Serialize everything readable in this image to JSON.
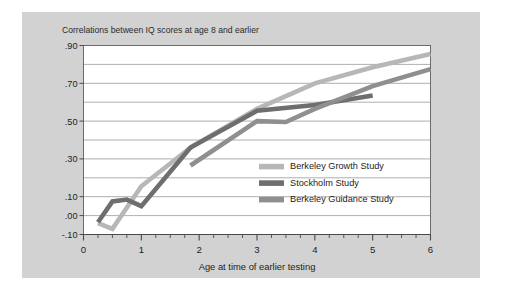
{
  "figure": {
    "background_color": "#ffffff",
    "panel_color": "#d2d2d2",
    "plot_color": "#ffffff"
  },
  "chart_data": {
    "type": "line",
    "title": "Correlations between IQ scores at age 8 and earlier",
    "xlabel": "Age at time of earlier testing",
    "ylabel": "",
    "xlim": [
      0,
      6
    ],
    "ylim": [
      -0.1,
      0.9
    ],
    "grid": true,
    "legend_position": "inside-lower-right",
    "xticks": [
      0,
      1,
      2,
      3,
      4,
      5,
      6
    ],
    "xtick_labels": [
      "0",
      "1",
      "2",
      "3",
      "4",
      "5",
      "6"
    ],
    "yticks": [
      0.9,
      0.7,
      0.5,
      0.3,
      0.1,
      0.0,
      -0.1
    ],
    "ytick_labels": [
      ".90",
      ".70",
      ".50",
      ".30",
      ".10",
      ".00",
      "-.10"
    ],
    "gridlines": [
      0.9,
      0.8,
      0.7,
      0.6,
      0.5,
      0.4,
      0.3,
      0.2,
      0.1,
      0.0,
      -0.1
    ],
    "series": [
      {
        "name": "Berkeley Growth Study",
        "color": "#b7b7b7",
        "x": [
          0.25,
          0.5,
          1.0,
          1.85,
          3.0,
          4.0,
          5.0,
          6.0
        ],
        "y": [
          -0.04,
          -0.07,
          0.155,
          0.36,
          0.565,
          0.7,
          0.785,
          0.855
        ]
      },
      {
        "name": "Stockholm Study",
        "color": "#6e6e6e",
        "x": [
          0.25,
          0.5,
          0.75,
          1.0,
          1.85,
          3.0,
          4.0,
          5.0
        ],
        "y": [
          -0.035,
          0.075,
          0.085,
          0.05,
          0.36,
          0.555,
          0.585,
          0.635
        ]
      },
      {
        "name": "Berkeley Guidance Study",
        "color": "#8f8f8f",
        "x": [
          1.85,
          3.0,
          3.5,
          4.0,
          5.0,
          6.0
        ],
        "y": [
          0.265,
          0.5,
          0.495,
          0.565,
          0.685,
          0.775
        ]
      }
    ]
  },
  "legend": {
    "entries": [
      {
        "label": "Berkeley Growth Study",
        "color": "#b7b7b7"
      },
      {
        "label": "Stockholm Study",
        "color": "#6e6e6e"
      },
      {
        "label": "Berkeley Guidance Study",
        "color": "#8f8f8f"
      }
    ]
  }
}
